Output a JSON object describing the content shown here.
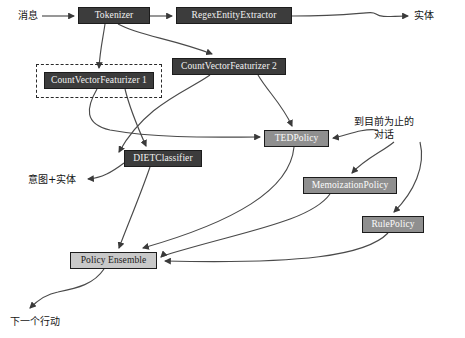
{
  "diagram": {
    "canvas": {
      "width": 465,
      "height": 338
    },
    "colors": {
      "dark_node_fill": "#3c3c3c",
      "mid_node_fill": "#8f8f8f",
      "light_node_fill": "#c9c9c9",
      "node_stroke": "#1c1c1c",
      "edge_stroke": "#4a4a4a",
      "background": "#ffffff"
    },
    "nodes": [
      {
        "id": "tokenizer",
        "label": "Tokenizer",
        "style": "dark",
        "x": 78,
        "y": 7,
        "w": 72,
        "h": 17
      },
      {
        "id": "regex",
        "label": "RegexEntityExtractor",
        "style": "dark",
        "x": 176,
        "y": 7,
        "w": 116,
        "h": 17
      },
      {
        "id": "cvf1",
        "label": "CountVectorFeaturizer 1",
        "style": "dark",
        "x": 44,
        "y": 72,
        "w": 110,
        "h": 17
      },
      {
        "id": "cvf2",
        "label": "CountVectorFeaturizer 2",
        "style": "dark",
        "x": 172,
        "y": 58,
        "w": 114,
        "h": 17
      },
      {
        "id": "ted",
        "label": "TEDPolicy",
        "style": "mid",
        "x": 264,
        "y": 130,
        "w": 65,
        "h": 17
      },
      {
        "id": "diet",
        "label": "DIETClassifier",
        "style": "dark",
        "x": 124,
        "y": 150,
        "w": 78,
        "h": 17
      },
      {
        "id": "memoization",
        "label": "MemoizationPolicy",
        "style": "mid",
        "x": 303,
        "y": 177,
        "w": 94,
        "h": 17
      },
      {
        "id": "rule",
        "label": "RulePolicy",
        "style": "mid",
        "x": 362,
        "y": 216,
        "w": 62,
        "h": 17
      },
      {
        "id": "ensemble",
        "label": "Policy Ensemble",
        "style": "light",
        "x": 70,
        "y": 252,
        "w": 87,
        "h": 17
      }
    ],
    "group_boxes": [
      {
        "id": "cvf1-group",
        "x": 36,
        "y": 64,
        "w": 126,
        "h": 34
      }
    ],
    "labels": [
      {
        "id": "input-message",
        "text": "消息",
        "x": 18,
        "y": 10,
        "align": "left"
      },
      {
        "id": "entity-output",
        "text": "实体",
        "x": 414,
        "y": 10,
        "align": "left"
      },
      {
        "id": "dialogue-state",
        "text": "到目前为止的\n对话",
        "x": 384,
        "y": 116,
        "align": "center"
      },
      {
        "id": "intent-entity",
        "text": "意图+实体",
        "x": 28,
        "y": 174,
        "align": "left"
      },
      {
        "id": "next-action",
        "text": "下一个行动",
        "x": 10,
        "y": 316,
        "align": "left"
      }
    ],
    "edges": [
      {
        "from": "消息",
        "to": "Tokenizer"
      },
      {
        "from": "Tokenizer",
        "to": "RegexEntityExtractor"
      },
      {
        "from": "RegexEntityExtractor",
        "to": "实体"
      },
      {
        "from": "Tokenizer",
        "to": "CountVectorFeaturizer 1"
      },
      {
        "from": "Tokenizer",
        "to": "CountVectorFeaturizer 2"
      },
      {
        "from": "CountVectorFeaturizer 1",
        "to": "DIETClassifier"
      },
      {
        "from": "CountVectorFeaturizer 1",
        "to": "TEDPolicy"
      },
      {
        "from": "CountVectorFeaturizer 2",
        "to": "DIETClassifier"
      },
      {
        "from": "CountVectorFeaturizer 2",
        "to": "TEDPolicy"
      },
      {
        "from": "DIETClassifier",
        "to": "意图+实体"
      },
      {
        "from": "DIETClassifier",
        "to": "Policy Ensemble"
      },
      {
        "from": "到目前为止的对话",
        "to": "TEDPolicy"
      },
      {
        "from": "到目前为止的对话",
        "to": "MemoizationPolicy"
      },
      {
        "from": "到目前为止的对话",
        "to": "RulePolicy"
      },
      {
        "from": "TEDPolicy",
        "to": "Policy Ensemble"
      },
      {
        "from": "MemoizationPolicy",
        "to": "Policy Ensemble"
      },
      {
        "from": "RulePolicy",
        "to": "Policy Ensemble"
      },
      {
        "from": "Policy Ensemble",
        "to": "下一个行动"
      }
    ]
  }
}
